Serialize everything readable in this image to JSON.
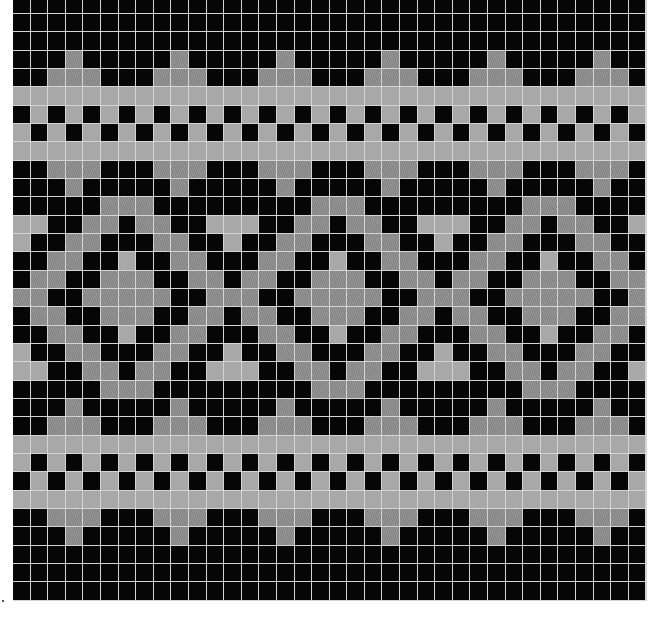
{
  "chart": {
    "type": "knitting-colorwork-chart",
    "columns": 36,
    "rows": 33,
    "legend": {
      "B": {
        "label": "black",
        "color": "#060606"
      },
      "L": {
        "label": "light gray",
        "color": "#a8a8a8"
      },
      "D": {
        "label": "hatched mid gray",
        "color": "#8c8c8c"
      }
    },
    "grid_line_color": "#d4d4d4",
    "pattern_rows": [
      "BBBBBBBBBBBBBBBBBBBBBBBBBBBBBBBBBBBB",
      "BBBBBBBBBBBBBBBBBBBBBBBBBBBBBBBBBBBB",
      "BBBBBBBBBBBBBBBBBBBBBBBBBBBBBBBBBBBB",
      "BBBDBBBBBDBBBBBDBBBBBDBBBBBDBBBBBDBB",
      "BBDDDBBBDDDBBBDDDBBBDDDBBBDDDBBBDDDB",
      "LLLLLLLLLLLLLLLLLLLLLLLLLLLLLLLLLLLL",
      "BLBLBLBLBLBLBLBLBLBLBLBLBLBLBLBLBLBL",
      "LBLBLBLBLBLBLBLBLBLBLBLBLBLBLBLBLBLB",
      "LLLLLLLLLLLLLLLLLLLLLLLLLLLLLLLLLLLL",
      "BBDDDBBBDDDBBBDDDBBBDDDBBBDDDBBBDDDB",
      "BBBDBBBBBDBBBBBDBBBBBDBBBBBDBBBBBDBB",
      "BBBBBDDDBBBBBBBBBDDDBBBBBBBBBDDDBBBB",
      "LLBBDDBDDBBLLLBBDDBDDBBLLLBBDDBDDBBL",
      "LBBDDBBBDDBBLBBDDBBBDDBBLBBDDBBBDDBB",
      "BBDDBBLBBDDBBBDDBBLBBDDBBBDDBBLBBDDB",
      "BDDBBDDDBBDDBDDBBDDDBBDDBDDBBDDDBBDD",
      "DDBBDDDDDBBDDDBBDDDDDBBDDDBBDDDDDBBD",
      "BDDBBDDDBBDDBDDBBDDDBBDDBDDBBDDDBBDD",
      "BBDDBBLBBDDBBBDDBBLBBDDBBBDDBBLBBDDB",
      "LBBDDBBBDDBBLBBDDBBBDDBBLBBDDBBBDDBB",
      "LLBBDDBDDBBLLLBBDDBDDBBLLLBBDDBDDBBL",
      "BBBBBDDDBBBBBBBBBDDDBBBBBBBBBDDDBBBB",
      "BBBDBBBBBDBBBBBDBBBBBDBBBBBDBBBBBDBB",
      "BBDDDBBBDDDBBBDDDBBBDDDBBBDDDBBBDDDB",
      "LLLLLLLLLLLLLLLLLLLLLLLLLLLLLLLLLLLL",
      "LBLBLBLBLBLBLBLBLBLBLBLBLBLBLBLBLBLB",
      "BLBLBLBLBLBLBLBLBLBLBLBLBLBLBLBLBLBL",
      "LLLLLLLLLLLLLLLLLLLLLLLLLLLLLLLLLLLL",
      "BBDDDBBBDDDBBBDDDBBBDDDBBBDDDBBBDDDB",
      "BBBDBBBBBDBBBBBDBBBBBDBBBBBDBBBBBDBB",
      "BBBBBBBBBBBBBBBBBBBBBBBBBBBBBBBBBBBB",
      "BBBBBBBBBBBBBBBBBBBBBBBBBBBBBBBBBBBB",
      "BBBBBBBBBBBBBBBBBBBBBBBBBBBBBBBBBBBB"
    ]
  }
}
